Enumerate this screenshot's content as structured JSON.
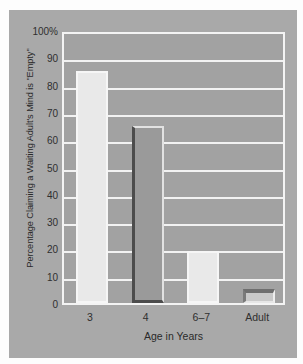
{
  "chart_data": {
    "type": "bar",
    "title": "",
    "categories": [
      "3",
      "4",
      "6–7",
      "Adult"
    ],
    "values": [
      85,
      65,
      19,
      5
    ],
    "xlabel": "Age in Years",
    "ylabel": "Percentage Claiming a Waiting Adult's Mind is \"Empty\"",
    "ylim": [
      0,
      100
    ],
    "yticks": [
      "100%",
      "90",
      "80",
      "70",
      "60",
      "50",
      "40",
      "30",
      "20",
      "10",
      "0"
    ],
    "ytick_values": [
      100,
      90,
      80,
      70,
      60,
      50,
      40,
      30,
      20,
      10,
      0
    ],
    "grid": true,
    "legend": false,
    "bar_colors": [
      "#e9e9e9",
      "#9a9a9a",
      "#e9e9e9",
      "#c9c9c9"
    ],
    "background": "#a9a9a9",
    "plot_background": "#a2a2a2",
    "gridline_color": "#f2f2f2"
  }
}
